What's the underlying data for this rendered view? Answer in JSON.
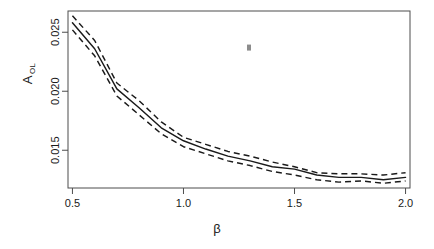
{
  "figure": {
    "width": 434,
    "height": 249,
    "background": "#ffffff",
    "foreground": "#1a1a1a",
    "frame_color": "#4d4d4d"
  },
  "axes": {
    "x_title": "β",
    "y_title_base": "A",
    "y_title_sub": "OL",
    "x_ticks": [
      "0.5",
      "1.0",
      "1.5",
      "2.0"
    ],
    "y_ticks": [
      "0.015",
      "0.020",
      "0.025"
    ]
  },
  "annotations": {
    "stray_mark_label": "stray-speck"
  },
  "chart_data": {
    "type": "line",
    "title": "",
    "subtitle": "",
    "xlabel": "β",
    "ylabel": "A_OL",
    "xlim": [
      0.48,
      2.02
    ],
    "ylim": [
      0.0118,
      0.0268
    ],
    "xticks": [
      0.5,
      1.0,
      1.5,
      2.0
    ],
    "yticks": [
      0.015,
      0.02,
      0.025
    ],
    "grid": false,
    "legend": null,
    "legend_position": "none",
    "x": [
      0.5,
      0.6,
      0.7,
      0.8,
      0.9,
      1.0,
      1.1,
      1.2,
      1.3,
      1.4,
      1.5,
      1.6,
      1.7,
      1.8,
      1.9,
      2.0
    ],
    "series": [
      {
        "name": "upper confidence band",
        "style": "dashed",
        "values": [
          0.0264,
          0.0243,
          0.0207,
          0.0192,
          0.0174,
          0.0161,
          0.0155,
          0.0149,
          0.0145,
          0.014,
          0.0136,
          0.0131,
          0.013,
          0.013,
          0.0129,
          0.0131
        ]
      },
      {
        "name": "estimate",
        "style": "solid",
        "values": [
          0.0258,
          0.0236,
          0.0202,
          0.0186,
          0.0169,
          0.0158,
          0.0151,
          0.0145,
          0.0141,
          0.0136,
          0.0134,
          0.0129,
          0.0127,
          0.0127,
          0.0125,
          0.0127
        ]
      },
      {
        "name": "lower confidence band",
        "style": "dashed",
        "values": [
          0.0252,
          0.023,
          0.0196,
          0.018,
          0.0164,
          0.0153,
          0.0147,
          0.0141,
          0.0137,
          0.0132,
          0.0129,
          0.0125,
          0.0123,
          0.0124,
          0.0122,
          0.0124
        ]
      }
    ],
    "stray_point": {
      "x": 1.295,
      "y": 0.0237
    }
  }
}
